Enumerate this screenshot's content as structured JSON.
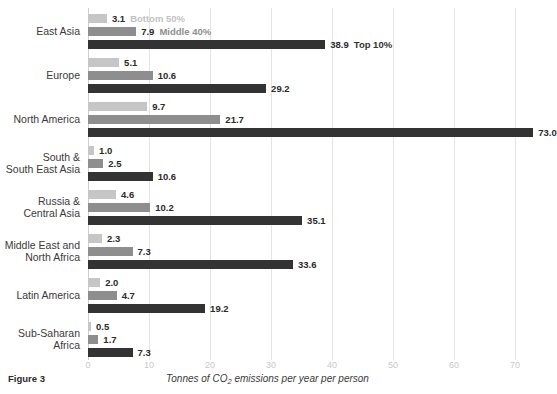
{
  "figure": {
    "label": "Figure 3",
    "axis_caption_prefix": "Tonnes of CO",
    "axis_caption_sub": "2",
    "axis_caption_suffix": " emissions per year per person"
  },
  "legend": [
    {
      "key": "bottom50",
      "label": "Bottom 50%",
      "color": "#c6c6c6"
    },
    {
      "key": "middle40",
      "label": "Middle 40%",
      "color": "#8e8e8e"
    },
    {
      "key": "top10",
      "label": "Top 10%",
      "color": "#333333"
    }
  ],
  "axis": {
    "ticks": [
      "0",
      "10",
      "20",
      "30",
      "40",
      "50",
      "60",
      "70"
    ],
    "tick_values": [
      0,
      10,
      20,
      30,
      40,
      50,
      60,
      70
    ],
    "min": 0,
    "max": 70,
    "tick_color": "#c9c9c9",
    "grid": true
  },
  "chart_data": {
    "type": "bar",
    "orientation": "horizontal",
    "title": "",
    "subtitle": "",
    "xlabel": "Tonnes of CO2 emissions per year per person",
    "ylabel": "",
    "xlim": [
      0,
      70
    ],
    "grid": true,
    "legend_position": "inline-first-group",
    "categories": [
      "East Asia",
      "Europe",
      "North America",
      "South &\nSouth East Asia",
      "Russia &\nCentral Asia",
      "Middle East and\nNorth Africa",
      "Latin America",
      "Sub-Saharan\nAfrica"
    ],
    "series": [
      {
        "name": "Bottom 50%",
        "color": "#c6c6c6",
        "values": [
          3.1,
          5.1,
          9.7,
          1.0,
          4.6,
          2.3,
          2.0,
          0.5
        ],
        "labels": [
          "3.1",
          "5.1",
          "9.7",
          "1.0",
          "4.6",
          "2.3",
          "2.0",
          "0.5"
        ]
      },
      {
        "name": "Middle 40%",
        "color": "#8e8e8e",
        "values": [
          7.9,
          10.6,
          21.7,
          2.5,
          10.2,
          7.3,
          4.7,
          1.7
        ],
        "labels": [
          "7.9",
          "10.6",
          "21.7",
          "2.5",
          "10.2",
          "7.3",
          "4.7",
          "1.7"
        ]
      },
      {
        "name": "Top 10%",
        "color": "#333333",
        "values": [
          38.9,
          29.2,
          73.0,
          10.6,
          35.1,
          33.6,
          19.2,
          7.3
        ],
        "labels": [
          "38.9",
          "29.2",
          "73.0",
          "10.6",
          "35.1",
          "33.6",
          "19.2",
          "7.3"
        ]
      }
    ]
  }
}
